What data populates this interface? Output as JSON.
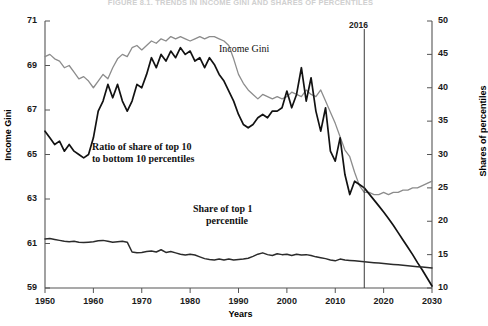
{
  "figure": {
    "title": "FIGURE 8.1. TRENDS IN INCOME GINI AND SHARES OF PERCENTILES"
  },
  "colors": {
    "income_gini": "#8c8c8c",
    "ratio_top10_bottom10": "#121212",
    "share_top1": "#2b2b2b",
    "axis": "#555555",
    "marker_line": "#3a3a3a",
    "text": "#111111",
    "background": "#ffffff"
  },
  "annotations": {
    "income_gini": "Income Gini",
    "ratio_line1": "Ratio of share of top 10",
    "ratio_line2": "to bottom 10 percentiles",
    "share_line1": "Share of top 1",
    "share_line2": "percentile",
    "marker_year": "2016"
  },
  "chart_data": {
    "type": "line",
    "title": "FIGURE 8.1. TRENDS IN INCOME GINI AND SHARES OF PERCENTILES",
    "xlabel": "Years",
    "ylabel": "Income Gini",
    "y2label": "Shares of percentiles",
    "xlim": [
      1950,
      2030
    ],
    "ylim": [
      59,
      71
    ],
    "y2lim": [
      10,
      50
    ],
    "xticks": [
      1950,
      1960,
      1970,
      1980,
      1990,
      2000,
      2010,
      2020,
      2030
    ],
    "yticks": [
      59,
      61,
      63,
      65,
      67,
      69,
      71
    ],
    "y2ticks": [
      10,
      15,
      20,
      25,
      30,
      35,
      40,
      45,
      50
    ],
    "grid": false,
    "legend": "in-plot annotations",
    "marker_line_x": 2016,
    "marker_line_label": "2016",
    "series": [
      {
        "name": "Income Gini",
        "axis": "left",
        "color": "#8c8c8c",
        "x": [
          1950,
          1951,
          1952,
          1953,
          1954,
          1955,
          1956,
          1957,
          1958,
          1959,
          1960,
          1961,
          1962,
          1963,
          1964,
          1965,
          1966,
          1967,
          1968,
          1969,
          1970,
          1971,
          1972,
          1973,
          1974,
          1975,
          1976,
          1977,
          1978,
          1979,
          1980,
          1981,
          1982,
          1983,
          1984,
          1985,
          1986,
          1987,
          1988,
          1989,
          1990,
          1991,
          1992,
          1993,
          1994,
          1995,
          1996,
          1997,
          1998,
          1999,
          2000,
          2001,
          2002,
          2003,
          2004,
          2005,
          2006,
          2007,
          2008,
          2009,
          2010,
          2011,
          2012,
          2013,
          2014,
          2015,
          2016,
          2017,
          2018,
          2019,
          2020,
          2021,
          2022,
          2023,
          2024,
          2025,
          2026,
          2027,
          2028,
          2029,
          2030
        ],
        "y": [
          69.4,
          69.5,
          69.3,
          69.2,
          68.9,
          69.0,
          68.7,
          68.4,
          68.5,
          68.3,
          68.0,
          68.3,
          68.6,
          68.4,
          68.9,
          69.3,
          69.5,
          69.4,
          69.8,
          69.9,
          69.7,
          69.9,
          70.1,
          70.0,
          70.2,
          70.1,
          70.3,
          70.2,
          70.3,
          70.2,
          70.1,
          70.2,
          70.3,
          70.2,
          70.3,
          70.3,
          70.2,
          70.1,
          69.9,
          69.3,
          68.6,
          68.2,
          67.9,
          67.7,
          67.5,
          67.7,
          67.6,
          67.5,
          67.6,
          67.5,
          67.6,
          67.8,
          67.7,
          67.6,
          67.9,
          67.7,
          67.6,
          67.9,
          67.4,
          66.9,
          66.4,
          65.8,
          65.2,
          64.9,
          64.2,
          63.6,
          63.3,
          63.3,
          63.2,
          63.2,
          63.3,
          63.2,
          63.3,
          63.3,
          63.4,
          63.4,
          63.5,
          63.5,
          63.6,
          63.7,
          63.8
        ]
      },
      {
        "name": "Ratio of share of top 10 to bottom 10 percentiles",
        "axis": "right",
        "color": "#121212",
        "x": [
          1950,
          1951,
          1952,
          1953,
          1954,
          1955,
          1956,
          1957,
          1958,
          1959,
          1960,
          1961,
          1962,
          1963,
          1964,
          1965,
          1966,
          1967,
          1968,
          1969,
          1970,
          1971,
          1972,
          1973,
          1974,
          1975,
          1976,
          1977,
          1978,
          1979,
          1980,
          1981,
          1982,
          1983,
          1984,
          1985,
          1986,
          1987,
          1988,
          1989,
          1990,
          1991,
          1992,
          1993,
          1994,
          1995,
          1996,
          1997,
          1998,
          1999,
          2000,
          2001,
          2002,
          2003,
          2004,
          2005,
          2006,
          2007,
          2008,
          2009,
          2010,
          2011,
          2012,
          2013,
          2014,
          2015,
          2016,
          2017,
          2018,
          2019,
          2020,
          2021,
          2022,
          2023,
          2024,
          2025,
          2026,
          2027,
          2028,
          2029,
          2030
        ],
        "y": [
          33.5,
          32.5,
          31.5,
          32.0,
          30.5,
          31.5,
          30.5,
          30.0,
          29.5,
          30.0,
          32.5,
          36.5,
          38.0,
          40.5,
          38.5,
          40.5,
          38.0,
          36.5,
          38.0,
          40.5,
          40.0,
          42.0,
          44.5,
          43.0,
          45.0,
          44.0,
          45.5,
          44.5,
          46.0,
          45.0,
          45.5,
          44.0,
          44.5,
          43.0,
          44.5,
          43.5,
          42.0,
          41.0,
          39.5,
          38.0,
          36.0,
          34.5,
          34.0,
          34.5,
          35.5,
          36.0,
          35.5,
          36.5,
          36.5,
          37.0,
          39.5,
          37.0,
          39.0,
          43.0,
          38.0,
          41.5,
          36.5,
          33.5,
          37.0,
          30.5,
          29.0,
          32.5,
          27.0,
          24.0,
          26.0,
          25.5,
          25.0,
          24.1,
          23.2,
          22.3,
          21.4,
          20.4,
          19.4,
          18.3,
          17.2,
          16.1,
          15.0,
          13.8,
          12.7,
          11.5,
          10.3
        ]
      },
      {
        "name": "Share of top 1 percentile",
        "axis": "left",
        "color": "#2b2b2b",
        "x": [
          1950,
          1951,
          1952,
          1953,
          1954,
          1955,
          1956,
          1957,
          1958,
          1959,
          1960,
          1961,
          1962,
          1963,
          1964,
          1965,
          1966,
          1967,
          1968,
          1969,
          1970,
          1971,
          1972,
          1973,
          1974,
          1975,
          1976,
          1977,
          1978,
          1979,
          1980,
          1981,
          1982,
          1983,
          1984,
          1985,
          1986,
          1987,
          1988,
          1989,
          1990,
          1991,
          1992,
          1993,
          1994,
          1995,
          1996,
          1997,
          1998,
          1999,
          2000,
          2001,
          2002,
          2003,
          2004,
          2005,
          2006,
          2007,
          2008,
          2009,
          2010,
          2011,
          2012,
          2013,
          2014,
          2015,
          2016,
          2017,
          2018,
          2019,
          2020,
          2021,
          2022,
          2023,
          2024,
          2025,
          2026,
          2027,
          2028,
          2029,
          2030
        ],
        "y": [
          61.2,
          61.22,
          61.18,
          61.14,
          61.1,
          61.08,
          61.1,
          61.06,
          61.04,
          61.06,
          61.08,
          61.12,
          61.14,
          61.1,
          61.06,
          61.08,
          61.1,
          61.06,
          60.62,
          60.58,
          60.6,
          60.64,
          60.66,
          60.62,
          60.72,
          60.6,
          60.64,
          60.58,
          60.52,
          60.48,
          60.52,
          60.48,
          60.4,
          60.32,
          60.28,
          60.26,
          60.3,
          60.26,
          60.3,
          60.26,
          60.28,
          60.3,
          60.34,
          60.42,
          60.52,
          60.58,
          60.5,
          60.46,
          60.54,
          60.5,
          60.52,
          60.46,
          60.52,
          60.48,
          60.5,
          60.46,
          60.4,
          60.36,
          60.32,
          60.26,
          60.22,
          60.3,
          60.26,
          60.24,
          60.22,
          60.2,
          60.18,
          60.16,
          60.14,
          60.12,
          60.1,
          60.08,
          60.06,
          60.04,
          60.02,
          60.0,
          59.98,
          59.96,
          59.94,
          59.92,
          59.9
        ]
      }
    ]
  }
}
